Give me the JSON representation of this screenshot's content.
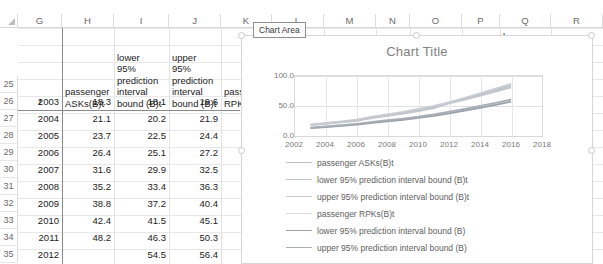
{
  "spreadsheet": {
    "column_headers": [
      "G",
      "H",
      "I",
      "J",
      "K",
      "L",
      "M",
      "N",
      "O",
      "P",
      "Q",
      "R"
    ],
    "row_headers": [
      "25",
      "26",
      "27",
      "28",
      "29",
      "30",
      "31",
      "32",
      "33",
      "34",
      "35"
    ],
    "header_row": {
      "G": "t",
      "H": "passenger ASKs(B)t",
      "I": "lower 95% prediction interval bound (B)t",
      "J": "upper 95% prediction interval bound (B)t",
      "K": "passenger RPKs",
      "Q": "lower",
      "R": "upper"
    },
    "header_lines": {
      "H": [
        "passenger",
        "ASKs(B)t"
      ],
      "I": [
        "lower",
        "95%",
        "prediction",
        "interval",
        "bound (B)t"
      ],
      "J": [
        "upper",
        "95%",
        "prediction",
        "interval",
        "bound (B)t"
      ],
      "K": [
        "pass",
        "RPK:"
      ]
    },
    "rows": [
      {
        "row": "26",
        "t": "2003",
        "ask": "18.3",
        "lower": "18.1",
        "upper": "19.6"
      },
      {
        "row": "27",
        "t": "2004",
        "ask": "21.1",
        "lower": "20.2",
        "upper": "21.9"
      },
      {
        "row": "28",
        "t": "2005",
        "ask": "23.7",
        "lower": "22.5",
        "upper": "24.4"
      },
      {
        "row": "29",
        "t": "2006",
        "ask": "26.4",
        "lower": "25.1",
        "upper": "27.2"
      },
      {
        "row": "30",
        "t": "2007",
        "ask": "31.6",
        "lower": "29.9",
        "upper": "32.5"
      },
      {
        "row": "31",
        "t": "2008",
        "ask": "35.2",
        "lower": "33.4",
        "upper": "36.3"
      },
      {
        "row": "32",
        "t": "2009",
        "ask": "38.8",
        "lower": "37.2",
        "upper": "40.4"
      },
      {
        "row": "33",
        "t": "2010",
        "ask": "42.4",
        "lower": "41.5",
        "upper": "45.1"
      },
      {
        "row": "34",
        "t": "2011",
        "ask": "48.2",
        "lower": "46.3",
        "upper": "50.3"
      },
      {
        "row": "35",
        "t": "2012",
        "ask": "",
        "lower": "54.5",
        "upper": "56.4"
      }
    ]
  },
  "chart_object": {
    "tooltip": "Chart Area"
  },
  "chart_data": {
    "type": "line",
    "title": "Chart Title",
    "xlabel": "",
    "ylabel": "",
    "xlim": [
      2002,
      2018
    ],
    "ylim": [
      0.0,
      100.0
    ],
    "grid": true,
    "legend_position": "bottom",
    "x_ticks": [
      "2002",
      "2004",
      "2006",
      "2008",
      "2010",
      "2012",
      "2014",
      "2016",
      "2018"
    ],
    "y_ticks": [
      "0.0",
      "50.0",
      "100.0"
    ],
    "x": [
      2003,
      2004,
      2005,
      2006,
      2007,
      2008,
      2009,
      2010,
      2011,
      2012,
      2013,
      2014,
      2015,
      2016
    ],
    "series": [
      {
        "name": "passenger ASKs(B)t",
        "color": "#b9c0c9",
        "values": [
          18.3,
          21.1,
          23.7,
          26.4,
          31.6,
          35.2,
          38.8,
          42.4,
          48.2,
          55.5,
          62.0,
          69.0,
          76.5,
          84.0
        ]
      },
      {
        "name": "lower 95% prediction interval bound (B)t",
        "color": "#c2c7cd",
        "values": [
          18.1,
          20.2,
          22.5,
          25.1,
          29.9,
          33.4,
          37.2,
          41.5,
          46.3,
          54.5,
          60.5,
          67.0,
          74.0,
          81.0
        ]
      },
      {
        "name": "upper 95% prediction interval bound (B)t",
        "color": "#c8ccd2",
        "values": [
          19.6,
          21.9,
          24.4,
          27.2,
          32.5,
          36.3,
          40.4,
          45.1,
          50.3,
          56.4,
          63.5,
          71.0,
          79.0,
          87.0
        ]
      },
      {
        "name": "passenger RPKs(B)t",
        "color": "#d8dbdf",
        "values": [
          13.5,
          15.4,
          17.4,
          19.5,
          22.6,
          25.2,
          27.9,
          30.9,
          34.7,
          39.0,
          43.5,
          48.5,
          53.5,
          59.0
        ]
      },
      {
        "name": "lower 95% prediction interval bound (B)",
        "color": "#9aa2ab",
        "values": [
          13.0,
          14.8,
          16.7,
          18.8,
          21.8,
          24.4,
          27.0,
          30.0,
          33.6,
          37.8,
          42.2,
          47.0,
          52.0,
          57.2
        ]
      },
      {
        "name": "upper 95% prediction interval bound (B)",
        "color": "#a8aeb6",
        "values": [
          14.2,
          16.1,
          18.2,
          20.4,
          23.6,
          26.3,
          29.1,
          32.2,
          36.1,
          40.5,
          45.1,
          50.2,
          55.4,
          61.0
        ]
      }
    ]
  }
}
